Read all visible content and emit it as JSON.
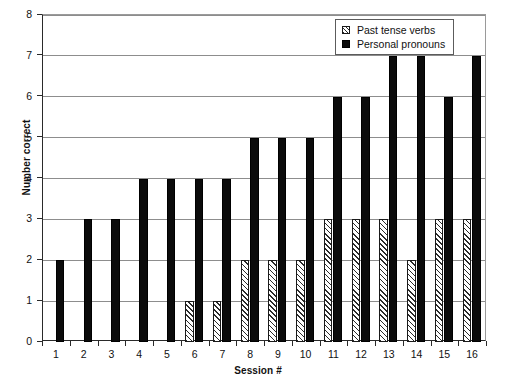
{
  "chart_data": {
    "type": "bar",
    "title": "",
    "xlabel": "Session #",
    "ylabel": "Number correct",
    "categories": [
      "1",
      "2",
      "3",
      "4",
      "5",
      "6",
      "7",
      "8",
      "9",
      "10",
      "11",
      "12",
      "13",
      "14",
      "15",
      "16"
    ],
    "ylim": [
      0,
      8
    ],
    "ytick_labels": [
      "0",
      "1",
      "2",
      "3",
      "4",
      "5",
      "6",
      "7",
      "8"
    ],
    "grid": true,
    "legend_position": "top-right",
    "series": [
      {
        "name": "Past tense verbs",
        "style": "hatched",
        "values": [
          0,
          0,
          0,
          0,
          0,
          1,
          1,
          2,
          2,
          2,
          3,
          3,
          3,
          2,
          3,
          3
        ]
      },
      {
        "name": "Personal pronouns",
        "style": "solid-black",
        "values": [
          2,
          3,
          3,
          4,
          4,
          4,
          4,
          5,
          5,
          5,
          6,
          6,
          7,
          7,
          6,
          7
        ]
      }
    ]
  },
  "legend": {
    "items": [
      {
        "label": "Past tense verbs",
        "swatch": "hatched-square-icon"
      },
      {
        "label": "Personal pronouns",
        "swatch": "filled-square-icon"
      }
    ]
  },
  "axes": {
    "y_title": "Number correct",
    "x_title": "Session #"
  }
}
